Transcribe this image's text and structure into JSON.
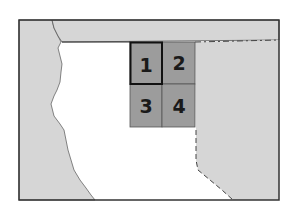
{
  "map": {
    "colors": {
      "background": "#ffffff",
      "land_gray": "#d6d6d6",
      "grid_fill": "#9c9c9c",
      "frame": "#333333",
      "highlight_border": "#111111"
    },
    "grid": {
      "cells": [
        {
          "label": "1",
          "highlighted": true
        },
        {
          "label": "2",
          "highlighted": false
        },
        {
          "label": "3",
          "highlighted": false
        },
        {
          "label": "4",
          "highlighted": false
        }
      ]
    }
  }
}
